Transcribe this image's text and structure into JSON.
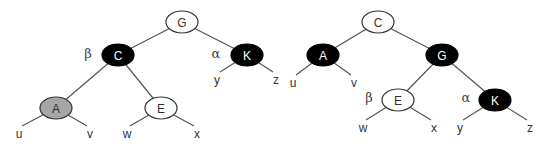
{
  "diagram": {
    "type": "tree-rotation",
    "colors": {
      "black": "#000000",
      "white": "#ffffff",
      "gray": "#a6a6a6",
      "edge": "#555555"
    },
    "trees": [
      {
        "name": "before",
        "nodes": [
          {
            "id": "G",
            "label": "G",
            "fill": "white",
            "x": 182,
            "y": 22
          },
          {
            "id": "C",
            "label": "C",
            "fill": "black",
            "x": 118,
            "y": 55
          },
          {
            "id": "K",
            "label": "K",
            "fill": "black",
            "x": 247,
            "y": 55
          },
          {
            "id": "A",
            "label": "A",
            "fill": "gray",
            "x": 56,
            "y": 108
          },
          {
            "id": "E",
            "label": "E",
            "fill": "white",
            "x": 161,
            "y": 108
          }
        ],
        "edges": [
          [
            "G",
            "C"
          ],
          [
            "G",
            "K"
          ],
          [
            "C",
            "A"
          ],
          [
            "C",
            "E"
          ]
        ],
        "leaves": [
          {
            "label": "u",
            "parent": "A",
            "x": 19,
            "y": 138
          },
          {
            "label": "v",
            "parent": "A",
            "x": 90,
            "y": 138
          },
          {
            "label": "w",
            "parent": "E",
            "x": 127,
            "y": 138
          },
          {
            "label": "x",
            "parent": "E",
            "x": 197,
            "y": 138
          },
          {
            "label": "y",
            "parent": "K",
            "x": 217,
            "y": 84
          },
          {
            "label": "z",
            "parent": "K",
            "x": 276,
            "y": 84
          }
        ],
        "annotations": [
          {
            "label": "β",
            "near": "C",
            "x": 88,
            "y": 58
          },
          {
            "label": "α",
            "near": "K",
            "x": 216,
            "y": 58
          }
        ]
      },
      {
        "name": "after",
        "nodes": [
          {
            "id": "C",
            "label": "C",
            "fill": "white",
            "x": 378,
            "y": 22
          },
          {
            "id": "A",
            "label": "A",
            "fill": "black",
            "x": 323,
            "y": 55
          },
          {
            "id": "G",
            "label": "G",
            "fill": "black",
            "x": 442,
            "y": 55
          },
          {
            "id": "E",
            "label": "E",
            "fill": "white",
            "x": 398,
            "y": 100
          },
          {
            "id": "K",
            "label": "K",
            "fill": "black",
            "x": 495,
            "y": 100
          }
        ],
        "edges": [
          [
            "C",
            "A"
          ],
          [
            "C",
            "G"
          ],
          [
            "G",
            "E"
          ],
          [
            "G",
            "K"
          ]
        ],
        "leaves": [
          {
            "label": "u",
            "parent": "A",
            "x": 293,
            "y": 87
          },
          {
            "label": "v",
            "parent": "A",
            "x": 354,
            "y": 87
          },
          {
            "label": "w",
            "parent": "E",
            "x": 363,
            "y": 132
          },
          {
            "label": "x",
            "parent": "E",
            "x": 434,
            "y": 132
          },
          {
            "label": "y",
            "parent": "K",
            "x": 460,
            "y": 132
          },
          {
            "label": "z",
            "parent": "K",
            "x": 530,
            "y": 132
          }
        ],
        "annotations": [
          {
            "label": "β",
            "near": "E",
            "x": 369,
            "y": 102
          },
          {
            "label": "α",
            "near": "K",
            "x": 466,
            "y": 102
          }
        ]
      }
    ]
  }
}
